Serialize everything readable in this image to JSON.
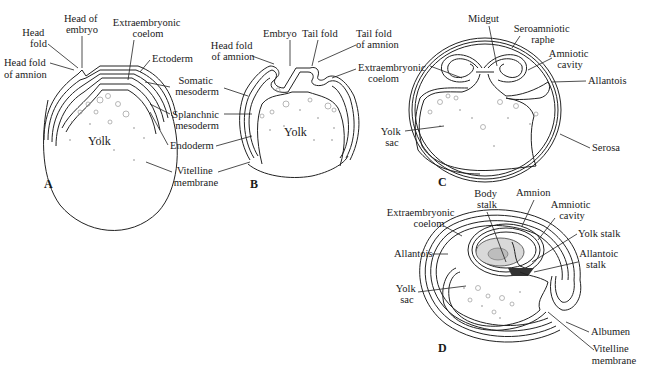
{
  "figure": {
    "panels": [
      {
        "id": "A",
        "panel_label": "A",
        "yolk_label": "Yolk",
        "labels": {
          "head_of_embryo": [
            "Head of",
            "embryo"
          ],
          "head_fold": [
            "Head",
            "fold"
          ],
          "head_fold_of_amnion": [
            "Head fold",
            "of amnion"
          ],
          "extraembryonic_coelom": [
            "Extraembryonic",
            "coelom"
          ],
          "ectoderm": [
            "Ectoderm"
          ],
          "somatic_mesoderm": [
            "Somatic",
            "mesoderm"
          ],
          "splanchnic_mesoderm": [
            "Splanchnic",
            "mesoderm"
          ],
          "endoderm": [
            "Endoderm"
          ],
          "vitelline_membrane": [
            "Vitelline",
            "membrane"
          ]
        }
      },
      {
        "id": "B",
        "panel_label": "B",
        "yolk_label": "Yolk",
        "labels": {
          "embryo": [
            "Embryo"
          ],
          "tail_fold": [
            "Tail fold"
          ],
          "tail_fold_of_amnion": [
            "Tail fold",
            "of amnion"
          ],
          "head_fold_of_amnion": [
            "Head fold",
            "of amnion"
          ],
          "extraembryonic_coelom": [
            "Extraembryonic",
            "coelom"
          ]
        }
      },
      {
        "id": "C",
        "panel_label": "C",
        "labels": {
          "midgut": [
            "Midgut"
          ],
          "seroamniotic_raphe": [
            "Seroamniotic",
            "raphe"
          ],
          "amniotic_cavity": [
            "Amniotic",
            "cavity"
          ],
          "allantois": [
            "Allantois"
          ],
          "extraembryonic_coelom": [
            "Extraembryonic",
            "coelom"
          ],
          "yolk_sac": [
            "Yolk",
            "sac"
          ],
          "serosa": [
            "Serosa"
          ]
        }
      },
      {
        "id": "D",
        "panel_label": "D",
        "labels": {
          "body_stalk": [
            "Body",
            "stalk"
          ],
          "amnion": [
            "Amnion"
          ],
          "amniotic_cavity": [
            "Amniotic",
            "cavity"
          ],
          "extraembryonic_coelom": [
            "Extraembryonic",
            "coelom"
          ],
          "yolk_stalk": [
            "Yolk stalk"
          ],
          "allantois": [
            "Allantois"
          ],
          "allantoic_stalk": [
            "Allantoic",
            "stalk"
          ],
          "yolk_sac": [
            "Yolk",
            "sac"
          ],
          "albumen": [
            "Albumen"
          ],
          "vitelline_membrane": [
            "Vitelline",
            "membrane"
          ]
        }
      }
    ]
  }
}
